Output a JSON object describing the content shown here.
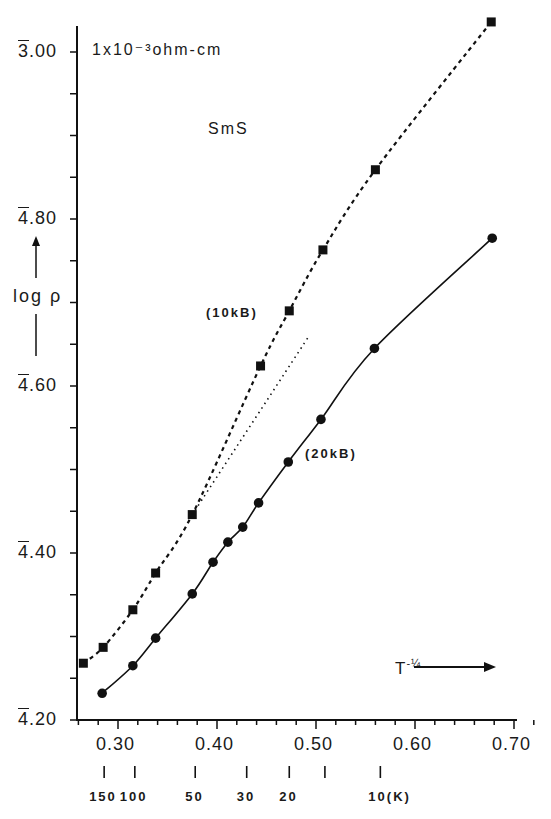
{
  "chart_data": {
    "type": "line",
    "title": "",
    "annotations": {
      "unit": "1x10⁻³ohm-cm",
      "sample": "SmS",
      "series_label_upper": "(10kB)",
      "series_label_lower": "(20kB)"
    },
    "xlabel": "T^-1/4",
    "xlabel_display": "T",
    "xlabel_exp": "-¼",
    "ylabel": "log ρ",
    "xlim": [
      0.26,
      0.72
    ],
    "ylim_display": [
      "4̅.20",
      "3̅.00"
    ],
    "ylim_numeric_barnotation": [
      4.2,
      5.0
    ],
    "x_ticks": [
      {
        "value": 0.3,
        "label": "0.30"
      },
      {
        "value": 0.4,
        "label": "0.40"
      },
      {
        "value": 0.5,
        "label": "0.50"
      },
      {
        "value": 0.6,
        "label": "0.60"
      },
      {
        "value": 0.7,
        "label": "0.70"
      }
    ],
    "y_ticks": [
      {
        "value": 4.2,
        "bar_digit": "4",
        "rest": ".20"
      },
      {
        "value": 4.4,
        "bar_digit": "4",
        "rest": ".40"
      },
      {
        "value": 4.6,
        "bar_digit": "4",
        "rest": ".60"
      },
      {
        "value": 4.8,
        "bar_digit": "4",
        "rest": ".80"
      },
      {
        "value": 5.0,
        "bar_digit": "3",
        "rest": ".00"
      }
    ],
    "temperature_axis": [
      {
        "x": 0.286,
        "label": "150"
      },
      {
        "x": 0.317,
        "label": "100"
      },
      {
        "x": 0.378,
        "label": "50"
      },
      {
        "x": 0.43,
        "label": "30"
      },
      {
        "x": 0.473,
        "label": "20"
      },
      {
        "x": 0.509,
        "label": ""
      },
      {
        "x": 0.565,
        "label": "10(K)"
      }
    ],
    "grid": false,
    "legend": "none (inline labels)",
    "series": [
      {
        "name": "10kB",
        "marker": "square",
        "line": "dashed",
        "x": [
          0.265,
          0.285,
          0.315,
          0.338,
          0.375,
          0.444,
          0.473,
          0.507,
          0.56,
          0.677
        ],
        "y": [
          4.268,
          4.287,
          4.332,
          4.376,
          4.446,
          4.624,
          4.69,
          4.763,
          4.859,
          5.036
        ]
      },
      {
        "name": "20kB",
        "marker": "circle",
        "line": "solid",
        "x": [
          0.284,
          0.315,
          0.338,
          0.375,
          0.396,
          0.411,
          0.426,
          0.442,
          0.472,
          0.505,
          0.559,
          0.678
        ],
        "y": [
          4.232,
          4.265,
          4.298,
          4.351,
          4.389,
          4.413,
          4.431,
          4.46,
          4.509,
          4.56,
          4.645,
          4.777
        ]
      },
      {
        "name": "extrapolation",
        "marker": "none",
        "line": "dotted",
        "x": [
          0.375,
          0.493
        ],
        "y": [
          4.446,
          4.66
        ]
      }
    ]
  }
}
